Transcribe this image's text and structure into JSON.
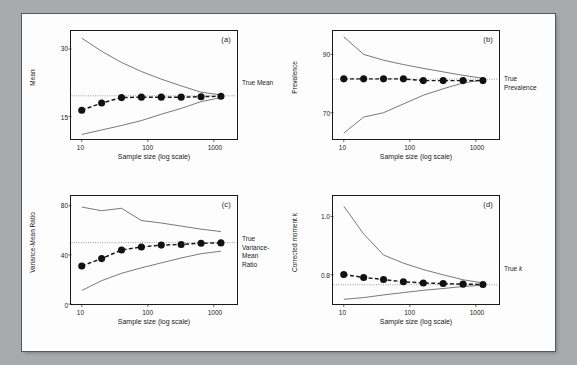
{
  "figure": {
    "background_color": "#a8abad",
    "page_color": "#fdfdfd",
    "point_color": "#111111",
    "line_color": "#1a1a1a"
  },
  "chart_data": [
    {
      "type": "line",
      "panel": "(a)",
      "title": "",
      "xlabel": "Sample size (log scale)",
      "ylabel": "Mean",
      "xscale": "log",
      "xlim": [
        7,
        2200
      ],
      "xticks": [
        10,
        100,
        1000
      ],
      "xtick_labels": [
        "10",
        "100",
        "1000"
      ],
      "ylim": [
        10,
        34
      ],
      "yticks": [
        15,
        30
      ],
      "ytick_labels": [
        "15",
        "30"
      ],
      "grid": false,
      "reference_line": {
        "value": 19.6,
        "label": "True Mean",
        "style": "dotted"
      },
      "annotation": "True Mean",
      "series": [
        {
          "name": "estimate",
          "style": "dashed-with-markers",
          "x": [
            10,
            20,
            40,
            80,
            160,
            320,
            640,
            1280
          ],
          "values": [
            16.4,
            18.0,
            19.2,
            19.3,
            19.3,
            19.3,
            19.4,
            19.5
          ]
        },
        {
          "name": "upper-envelope",
          "style": "solid-thin",
          "x": [
            10,
            20,
            40,
            80,
            160,
            320,
            640,
            1280
          ],
          "values": [
            32.4,
            29.5,
            27.0,
            25.0,
            23.3,
            21.8,
            20.4,
            19.8
          ]
        },
        {
          "name": "lower-envelope",
          "style": "solid-thin",
          "x": [
            10,
            20,
            40,
            80,
            160,
            320,
            640,
            1280
          ],
          "values": [
            11.0,
            12.0,
            13.0,
            14.1,
            15.5,
            16.8,
            18.3,
            19.2
          ]
        }
      ]
    },
    {
      "type": "line",
      "panel": "(b)",
      "title": "",
      "xlabel": "Sample size (log scale)",
      "ylabel": "Prevalence",
      "xscale": "log",
      "xlim": [
        7,
        2200
      ],
      "xticks": [
        10,
        100,
        1000
      ],
      "xtick_labels": [
        "10",
        "100",
        "1000"
      ],
      "ylim": [
        61,
        98
      ],
      "yticks": [
        70,
        90
      ],
      "ytick_labels": [
        "70",
        "90"
      ],
      "grid": false,
      "reference_line": {
        "value": 81.5,
        "label": "True Prevalence",
        "style": "dotted"
      },
      "annotation": "True\nPrevalence",
      "series": [
        {
          "name": "estimate",
          "style": "dashed-with-markers",
          "x": [
            10,
            20,
            40,
            80,
            160,
            320,
            640,
            1280
          ],
          "values": [
            81.6,
            81.6,
            81.6,
            81.6,
            81.0,
            81.0,
            81.0,
            81.0
          ]
        },
        {
          "name": "upper-envelope",
          "style": "solid-thin",
          "x": [
            10,
            20,
            40,
            80,
            160,
            320,
            640,
            1280
          ],
          "values": [
            96.0,
            90.0,
            88.0,
            86.5,
            85.2,
            84.0,
            82.8,
            81.8
          ]
        },
        {
          "name": "lower-envelope",
          "style": "solid-thin",
          "x": [
            10,
            20,
            40,
            80,
            160,
            320,
            640,
            1280
          ],
          "values": [
            63.0,
            68.5,
            70.0,
            73.0,
            76.0,
            78.2,
            80.2,
            81.2
          ]
        }
      ]
    },
    {
      "type": "line",
      "panel": "(c)",
      "title": "",
      "xlabel": "Sample size (log scale)",
      "ylabel": "Variance-Mean Ratio",
      "xscale": "log",
      "xlim": [
        7,
        2200
      ],
      "xticks": [
        10,
        100,
        1000
      ],
      "xtick_labels": [
        "10",
        "100",
        "1000"
      ],
      "ylim": [
        0,
        88
      ],
      "yticks": [
        0,
        40,
        80
      ],
      "ytick_labels": [
        "0",
        "40",
        "80"
      ],
      "grid": false,
      "reference_line": {
        "value": 50.0,
        "label": "True Variance-Mean Ratio",
        "style": "dotted"
      },
      "annotation": "True\nVariance-\nMean\nRatio",
      "series": [
        {
          "name": "estimate",
          "style": "dashed-with-markers",
          "x": [
            10,
            20,
            40,
            80,
            160,
            320,
            640,
            1280
          ],
          "values": [
            31.0,
            37.0,
            44.0,
            46.5,
            48.0,
            48.5,
            49.5,
            49.8
          ]
        },
        {
          "name": "upper-envelope",
          "style": "solid-thin",
          "x": [
            10,
            20,
            40,
            80,
            160,
            320,
            640,
            1280
          ],
          "values": [
            79.0,
            76.0,
            78.0,
            68.0,
            66.0,
            63.5,
            61.0,
            59.0
          ]
        },
        {
          "name": "lower-envelope",
          "style": "solid-thin",
          "x": [
            10,
            20,
            40,
            80,
            160,
            320,
            640,
            1280
          ],
          "values": [
            11.0,
            19.0,
            25.0,
            29.5,
            33.5,
            37.5,
            41.0,
            43.0
          ]
        }
      ]
    },
    {
      "type": "line",
      "panel": "(d)",
      "title": "",
      "xlabel": "Sample size (log scale)",
      "ylabel": "Corrected moment k",
      "xscale": "log",
      "xlim": [
        7,
        2200
      ],
      "xticks": [
        10,
        100,
        1000
      ],
      "xtick_labels": [
        "10",
        "100",
        "1000"
      ],
      "ylim": [
        0.7,
        1.07
      ],
      "yticks": [
        0.8,
        1.0
      ],
      "ytick_labels": [
        "0.8",
        "1.0"
      ],
      "grid": false,
      "reference_line": {
        "value": 0.766,
        "label": "True k",
        "style": "dotted"
      },
      "annotation": "True k",
      "series": [
        {
          "name": "estimate",
          "style": "dashed-with-markers",
          "x": [
            10,
            20,
            40,
            80,
            160,
            320,
            640,
            1280
          ],
          "values": [
            0.801,
            0.791,
            0.784,
            0.776,
            0.772,
            0.77,
            0.768,
            0.767
          ]
        },
        {
          "name": "upper-envelope",
          "style": "solid-thin",
          "x": [
            10,
            20,
            40,
            80,
            160,
            320,
            640,
            1280
          ],
          "values": [
            1.035,
            0.94,
            0.868,
            0.84,
            0.818,
            0.8,
            0.783,
            0.772
          ]
        },
        {
          "name": "lower-envelope",
          "style": "solid-thin",
          "x": [
            10,
            20,
            40,
            80,
            160,
            320,
            640,
            1280
          ],
          "values": [
            0.716,
            0.722,
            0.731,
            0.739,
            0.747,
            0.753,
            0.76,
            0.764
          ]
        }
      ]
    }
  ]
}
